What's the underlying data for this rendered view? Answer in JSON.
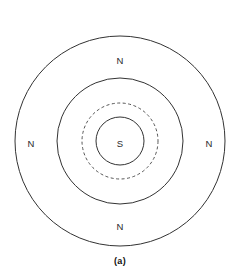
{
  "figure": {
    "caption": "(a)",
    "background_color": "#ffffff",
    "stroke_color": "#333333",
    "dashed_stroke_color": "#555555",
    "label_color": "#2b2b2b",
    "center": {
      "x": 120,
      "y": 141
    }
  },
  "rings": [
    {
      "id": "outer-ring",
      "name": "outer-circle",
      "radius": 105,
      "style": "solid",
      "stroke_width": 1
    },
    {
      "id": "middle-ring",
      "name": "middle-circle",
      "radius": 63,
      "style": "solid",
      "stroke_width": 1
    },
    {
      "id": "dashed-ring",
      "name": "dashed-circle",
      "radius": 38,
      "style": "dashed",
      "stroke_width": 1,
      "dash_pattern": "3 2.5"
    },
    {
      "id": "inner-ring",
      "name": "inner-circle",
      "radius": 24,
      "style": "solid",
      "stroke_width": 1
    }
  ],
  "pole_labels": [
    {
      "id": "north-top",
      "text": "N",
      "x": 120,
      "y": 60
    },
    {
      "id": "north-left",
      "text": "N",
      "x": 31,
      "y": 143
    },
    {
      "id": "north-right",
      "text": "N",
      "x": 209,
      "y": 143
    },
    {
      "id": "north-bottom",
      "text": "N",
      "x": 120,
      "y": 226
    },
    {
      "id": "south-center",
      "text": "S",
      "x": 120,
      "y": 143
    }
  ],
  "chart_data": {
    "type": "diagram",
    "title": "(a)",
    "series": [
      {
        "name": "concentric-circles",
        "values": [
          105,
          63,
          38,
          24
        ],
        "styles": [
          "solid",
          "solid",
          "dashed",
          "solid"
        ],
        "units": "px radius",
        "center": [
          120,
          141
        ]
      }
    ],
    "annotations": [
      {
        "label": "N",
        "position": "top",
        "x": 120,
        "y": 60
      },
      {
        "label": "N",
        "position": "left",
        "x": 31,
        "y": 143
      },
      {
        "label": "N",
        "position": "right",
        "x": 209,
        "y": 143
      },
      {
        "label": "N",
        "position": "bottom",
        "x": 120,
        "y": 226
      },
      {
        "label": "S",
        "position": "center",
        "x": 120,
        "y": 143
      }
    ],
    "legend": null,
    "grid": false
  }
}
